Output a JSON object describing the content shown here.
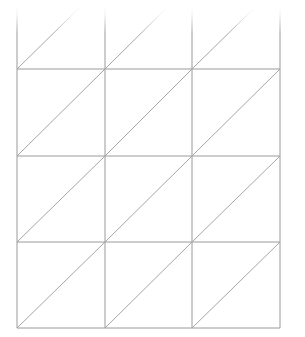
{
  "figure": {
    "background_color": "#ffffff",
    "line_color": "#9a9a9a",
    "diagonal_color": "#a6a6a6",
    "line_width": 1,
    "canvas_width": 305,
    "canvas_height": 337
  },
  "chart_data": {
    "type": "diagram",
    "columns": 3,
    "rows": 4,
    "cells_total": 12,
    "triangles_total": 24,
    "diagonal_direction": "bottom-left-to-top-right",
    "top_row_cropped": true,
    "top_border_visible": false,
    "grid": {
      "vertical_line_x": [
        17,
        105,
        192,
        280
      ],
      "horizontal_line_y": [
        69,
        156,
        242,
        328
      ],
      "top_edge_y": 0,
      "cell_width": 87.7,
      "cell_height": 86.3
    },
    "xlabel": "",
    "ylabel": "",
    "grid_on": true,
    "legend": []
  }
}
